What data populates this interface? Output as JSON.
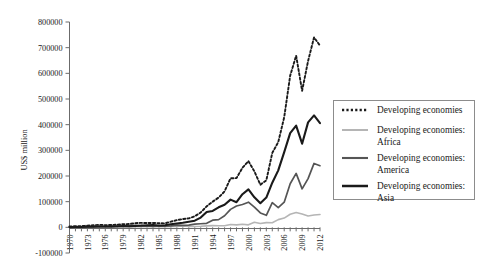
{
  "chart": {
    "type": "line",
    "title": "",
    "xlabel": "",
    "ylabel": "US$ million",
    "ylim": [
      -100000,
      800000
    ],
    "ytick_labels": [
      "800000",
      "700000",
      "600000",
      "500000",
      "400000",
      "300000",
      "200000",
      "100000",
      "0",
      "-100000"
    ],
    "ytick_values": [
      800000,
      700000,
      600000,
      500000,
      400000,
      300000,
      200000,
      100000,
      0,
      -100000
    ],
    "xtick_labels": [
      "1970",
      "1973",
      "1976",
      "1979",
      "1982",
      "1985",
      "1988",
      "1991",
      "1994",
      "1997",
      "2000",
      "2003",
      "2006",
      "2009",
      "2012"
    ],
    "grid": false,
    "legend_position": "right"
  },
  "chart_data": {
    "type": "line",
    "title": "",
    "xlabel": "",
    "ylabel": "US$ million",
    "ylim": [
      -100000,
      800000
    ],
    "xlim": [
      1970,
      2012
    ],
    "grid": false,
    "legend_position": "right",
    "x": [
      1970,
      1971,
      1972,
      1973,
      1974,
      1975,
      1976,
      1977,
      1978,
      1979,
      1980,
      1981,
      1982,
      1983,
      1984,
      1985,
      1986,
      1987,
      1988,
      1989,
      1990,
      1991,
      1992,
      1993,
      1994,
      1995,
      1996,
      1997,
      1998,
      1999,
      2000,
      2001,
      2002,
      2003,
      2004,
      2005,
      2006,
      2007,
      2008,
      2009,
      2010,
      2011,
      2012
    ],
    "xtick_labels": [
      "1970",
      "1973",
      "1976",
      "1979",
      "1982",
      "1985",
      "1988",
      "1991",
      "1994",
      "1997",
      "2000",
      "2003",
      "2006",
      "2009",
      "2012"
    ],
    "ytick_labels": [
      "-100000",
      "0",
      "100000",
      "200000",
      "300000",
      "400000",
      "500000",
      "600000",
      "700000",
      "800000"
    ],
    "series": [
      {
        "name": "Developing economies",
        "color": "#1a1a1a",
        "style": "dotted",
        "width": 1.9,
        "values": [
          3500,
          4200,
          5000,
          6500,
          8000,
          9500,
          8500,
          9000,
          10500,
          12000,
          13000,
          16000,
          17500,
          16500,
          17000,
          16000,
          15500,
          22000,
          28000,
          32000,
          35000,
          43000,
          58000,
          82000,
          100000,
          116000,
          140000,
          191000,
          192000,
          232000,
          258000,
          218000,
          166000,
          183000,
          290000,
          332000,
          429000,
          591000,
          669000,
          532000,
          648000,
          740000,
          708000
        ]
      },
      {
        "name": "Developing economies: Africa",
        "color": "#b5b5b5",
        "style": "solid",
        "width": 1.6,
        "values": [
          1200,
          1300,
          1500,
          1800,
          2300,
          2600,
          2200,
          2000,
          2100,
          2200,
          1900,
          2200,
          2100,
          2000,
          2500,
          2700,
          2500,
          3000,
          3500,
          5200,
          3000,
          3500,
          4000,
          5500,
          6500,
          6000,
          6000,
          11000,
          9500,
          12000,
          9700,
          20000,
          15000,
          18500,
          18000,
          30000,
          36000,
          51000,
          58000,
          52000,
          44000,
          48000,
          50000
        ]
      },
      {
        "name": "Developing economies: America",
        "color": "#555555",
        "style": "solid",
        "width": 1.7,
        "values": [
          1300,
          1600,
          1800,
          2000,
          2800,
          3400,
          2800,
          2800,
          3800,
          4600,
          6500,
          8200,
          7500,
          5200,
          4100,
          5400,
          4500,
          5600,
          8500,
          8000,
          8900,
          12500,
          14000,
          15500,
          28000,
          30000,
          45000,
          70000,
          83000,
          89000,
          98000,
          79000,
          56000,
          47000,
          96000,
          77000,
          98000,
          170000,
          210000,
          150000,
          190000,
          249000,
          240000
        ]
      },
      {
        "name": "Developing economies: Asia",
        "color": "#1a1a1a",
        "style": "solid",
        "width": 2.1,
        "values": [
          900,
          1200,
          1500,
          2500,
          2800,
          3200,
          3100,
          3700,
          4200,
          5000,
          4500,
          5300,
          6000,
          7800,
          9000,
          7000,
          8000,
          12000,
          15000,
          18000,
          22000,
          26000,
          38000,
          60000,
          64000,
          78000,
          88000,
          108000,
          98000,
          129000,
          148000,
          117000,
          94000,
          116000,
          174000,
          222000,
          293000,
          367000,
          396000,
          326000,
          409000,
          436000,
          406000
        ]
      }
    ]
  },
  "legend": {
    "items": [
      {
        "label_line1": "Developing economies",
        "label_line2": ""
      },
      {
        "label_line1": "Developing economies:",
        "label_line2": "Africa"
      },
      {
        "label_line1": "Developing economies:",
        "label_line2": "America"
      },
      {
        "label_line1": "Developing economies:",
        "label_line2": "Asia"
      }
    ]
  }
}
